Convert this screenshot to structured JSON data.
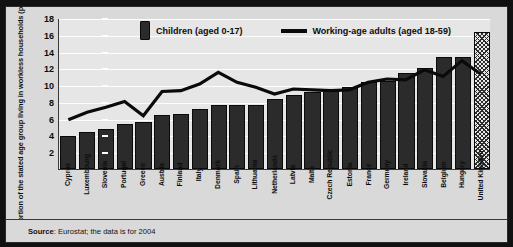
{
  "legend": {
    "bars_label": "Children (aged 0-17)",
    "line_label": "Working-age adults (aged 18-59)",
    "bar_swatch_icon": "bar-swatch-icon",
    "line_swatch_icon": "line-swatch-icon"
  },
  "footer": {
    "source_prefix": "Source",
    "source_text": ": Eurostat; the data is for 2004"
  },
  "chart_data": {
    "type": "bar",
    "title": "",
    "xlabel": "",
    "ylabel": "Proportion of the stated age group living in workless households (per cent)",
    "ylim": [
      0,
      18
    ],
    "yticks": [
      2,
      4,
      6,
      8,
      10,
      12,
      14,
      16,
      18
    ],
    "ytick_labels": [
      "2",
      "4",
      "6",
      "8",
      "10",
      "12",
      "14",
      "16",
      "18"
    ],
    "grid": true,
    "legend_position": "top-center",
    "categories": [
      "Cyprus",
      "Luxembourg",
      "Slovenia",
      "Portugal",
      "Greece",
      "Austria",
      "Finland",
      "Italy",
      "Denmark",
      "Spain",
      "Lithuania",
      "Netherlands",
      "Latvia",
      "Malta",
      "Czech Republic",
      "Estonia",
      "France",
      "Germany",
      "Ireland",
      "Slovakia",
      "Belgium",
      "Hungary",
      "United Kingdom"
    ],
    "series": [
      {
        "name": "Children (aged 0-17)",
        "type": "bar",
        "color": "#2b2b2b",
        "values": [
          3.9,
          4.4,
          4.8,
          5.4,
          5.6,
          6.4,
          6.6,
          7.1,
          7.6,
          7.6,
          7.6,
          8.4,
          8.8,
          9.2,
          9.3,
          9.8,
          10.4,
          10.5,
          11.4,
          12.0,
          13.3,
          13.4,
          16.3
        ],
        "highlight_index": 22,
        "highlight_style": "hatched"
      },
      {
        "name": "Working-age adults (aged 18-59)",
        "type": "line",
        "color": "#0a0a0a",
        "values": [
          5.9,
          6.8,
          7.4,
          8.1,
          6.4,
          9.3,
          9.4,
          10.2,
          11.6,
          10.4,
          9.8,
          9.0,
          9.6,
          9.5,
          9.4,
          9.5,
          10.4,
          10.8,
          10.7,
          11.9,
          11.1,
          13.0,
          11.4
        ]
      }
    ]
  }
}
